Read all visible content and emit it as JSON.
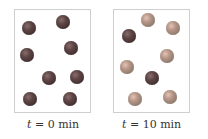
{
  "panels": [
    {
      "id": "t0",
      "label_var": "t",
      "label_eq": " = 0 min",
      "spheres": [
        {
          "x": 29,
          "y": 28,
          "type": "dark"
        },
        {
          "x": 63,
          "y": 22,
          "type": "dark"
        },
        {
          "x": 27,
          "y": 55,
          "type": "dark"
        },
        {
          "x": 71,
          "y": 48,
          "type": "dark"
        },
        {
          "x": 49,
          "y": 78,
          "type": "dark"
        },
        {
          "x": 77,
          "y": 77,
          "type": "dark"
        },
        {
          "x": 30,
          "y": 99,
          "type": "dark"
        },
        {
          "x": 70,
          "y": 99,
          "type": "dark"
        }
      ]
    },
    {
      "id": "t10",
      "label_var": "t",
      "label_eq": " = 10 min",
      "spheres": [
        {
          "x": 148,
          "y": 20,
          "type": "light"
        },
        {
          "x": 173,
          "y": 28,
          "type": "light"
        },
        {
          "x": 129,
          "y": 36,
          "type": "dark"
        },
        {
          "x": 167,
          "y": 56,
          "type": "light"
        },
        {
          "x": 127,
          "y": 67,
          "type": "light"
        },
        {
          "x": 152,
          "y": 78,
          "type": "dark"
        },
        {
          "x": 135,
          "y": 99,
          "type": "light"
        },
        {
          "x": 170,
          "y": 97,
          "type": "light"
        }
      ]
    }
  ],
  "colors": {
    "dark_sphere": "#4a3535",
    "light_sphere": "#b09080",
    "panel_border": "#cfcfcf"
  }
}
